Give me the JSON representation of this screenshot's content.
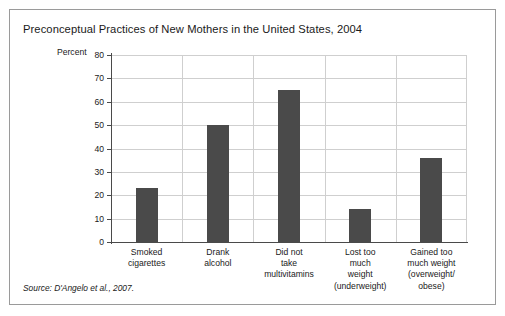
{
  "figure": {
    "title": "Preconceptual Practices of New Mothers in the United States, 2004",
    "source": "Source: D'Angelo et al., 2007."
  },
  "chart_data": {
    "type": "bar",
    "title": "Preconceptual Practices of New Mothers in the United States, 2004",
    "xlabel": "",
    "ylabel": "Percent",
    "ylim": [
      0,
      80
    ],
    "ytick_step": 10,
    "yticks": [
      0,
      10,
      20,
      30,
      40,
      50,
      60,
      70,
      80
    ],
    "ytick_labels": [
      "0",
      "10",
      "20",
      "30",
      "40",
      "50",
      "60",
      "70",
      "80"
    ],
    "grid": true,
    "legend": false,
    "bar_color": "#4a4a4a",
    "grid_color": "#cfcfcf",
    "axis_color": "#4a4a4a",
    "categories": [
      "Smoked cigarettes",
      "Drank alcohol",
      "Did not take multivitamins",
      "Lost too much weight (underweight)",
      "Gained too much weight (overweight/obese)"
    ],
    "category_lines": [
      [
        "Smoked",
        "cigarettes"
      ],
      [
        "Drank",
        "alcohol"
      ],
      [
        "Did not",
        "take",
        "multivitamins"
      ],
      [
        "Lost too",
        "much",
        "weight",
        "(underweight)"
      ],
      [
        "Gained too",
        "much weight",
        "(overweight/",
        "obese)"
      ]
    ],
    "values": [
      23,
      50,
      65,
      14,
      36
    ]
  }
}
